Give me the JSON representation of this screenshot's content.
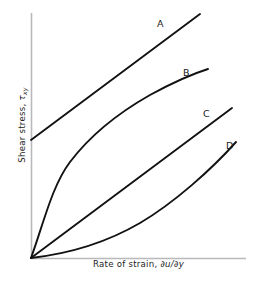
{
  "figure": {
    "background_color": "#ffffff",
    "axis_color": "#b9b9bd",
    "curve_color": "#121212",
    "text_color": "#1c1c1c"
  },
  "axes": {
    "y_title_prefix": "Shear stress, ",
    "y_title_symbol": "τ",
    "y_title_subscript": "xy",
    "x_title_prefix": "Rate of strain, ",
    "x_title_symbol": "∂u/∂y",
    "y_title_full": "Shear stress, τxy",
    "x_title_full": "Rate of strain, ∂u/∂y"
  },
  "labels": {
    "a": "A",
    "b": "B",
    "c": "C",
    "d": "D"
  },
  "chart_data": {
    "type": "line",
    "title": "",
    "xlabel": "Rate of strain, ∂u/∂y",
    "ylabel": "Shear stress, τxy",
    "xlim": [
      0,
      1
    ],
    "ylim": [
      0,
      1
    ],
    "grid": false,
    "legend": "inline-curve-labels",
    "annotations": [
      "A",
      "B",
      "C",
      "D"
    ],
    "series": [
      {
        "name": "A",
        "label": "A",
        "description": "Bingham plastic: straight line with positive yield-stress intercept",
        "path": "M 31 140 L 200 14",
        "x": [
          0.0,
          0.2,
          0.4,
          0.6,
          0.79
        ],
        "y": [
          0.48,
          0.61,
          0.74,
          0.87,
          1.0
        ]
      },
      {
        "name": "B",
        "label": "B",
        "description": "Pseudoplastic (shear-thinning): steep initial slope, flattening",
        "path": "M 31 258 C 44 222 52 186 70 162 C 92 133 120 112 150 95 C 172 83 192 74 208 69",
        "x": [
          0.0,
          0.05,
          0.12,
          0.2,
          0.35,
          0.55,
          0.7,
          0.82
        ],
        "y": [
          0.0,
          0.26,
          0.46,
          0.58,
          0.7,
          0.79,
          0.84,
          0.87
        ]
      },
      {
        "name": "C",
        "label": "C",
        "description": "Newtonian fluid: straight line through the origin",
        "path": "M 31 258 L 232 108",
        "x": [
          0.0,
          0.25,
          0.5,
          0.75,
          0.94
        ],
        "y": [
          0.0,
          0.16,
          0.31,
          0.47,
          0.59
        ]
      },
      {
        "name": "D",
        "label": "D",
        "description": "Dilatant (shear-thickening): shallow initial slope, steepening",
        "path": "M 31 258 C 66 254 104 244 140 223 C 174 203 212 169 236 142",
        "x": [
          0.0,
          0.15,
          0.3,
          0.5,
          0.7,
          0.85,
          0.97
        ],
        "y": [
          0.0,
          0.02,
          0.05,
          0.12,
          0.23,
          0.35,
          0.46
        ]
      }
    ],
    "label_positions": [
      {
        "label": "A",
        "x": 157,
        "y": 27
      },
      {
        "label": "B",
        "x": 183,
        "y": 76
      },
      {
        "label": "C",
        "x": 203,
        "y": 117
      },
      {
        "label": "D",
        "x": 226,
        "y": 149
      }
    ]
  }
}
